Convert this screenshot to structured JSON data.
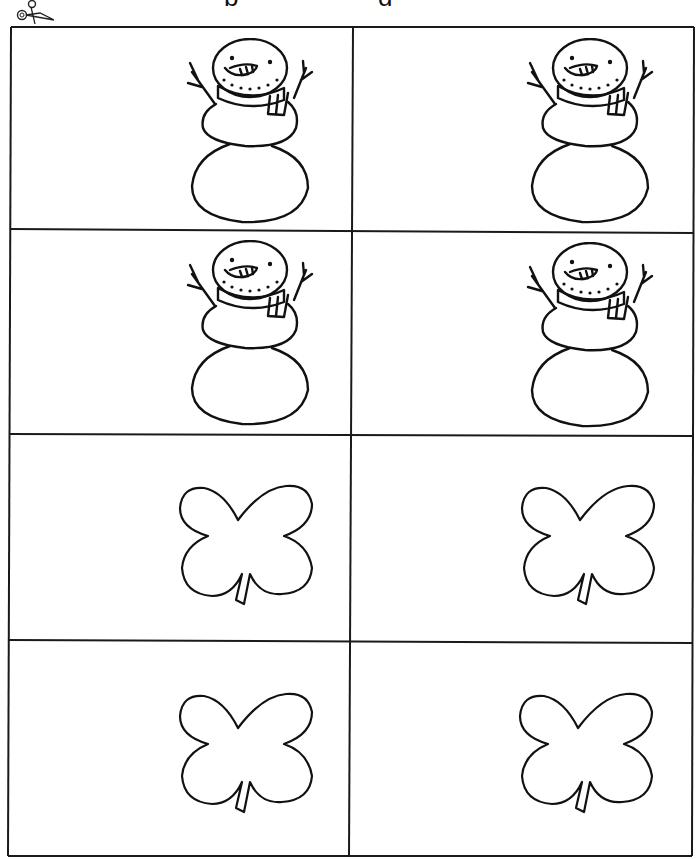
{
  "page": {
    "title_fragment": [
      "p",
      "g"
    ],
    "cut_line_icon": "scissors-icon"
  },
  "cards": [
    {
      "row": 1,
      "col": 1,
      "picture": "snowman"
    },
    {
      "row": 1,
      "col": 2,
      "picture": "snowman"
    },
    {
      "row": 2,
      "col": 1,
      "picture": "snowman"
    },
    {
      "row": 2,
      "col": 2,
      "picture": "snowman"
    },
    {
      "row": 3,
      "col": 1,
      "picture": "shamrock"
    },
    {
      "row": 3,
      "col": 2,
      "picture": "shamrock"
    },
    {
      "row": 4,
      "col": 1,
      "picture": "shamrock"
    },
    {
      "row": 4,
      "col": 2,
      "picture": "shamrock"
    }
  ],
  "colors": {
    "ink": "#111111",
    "paper": "#ffffff"
  }
}
